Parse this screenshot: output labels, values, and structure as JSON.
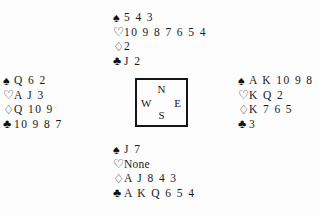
{
  "diagram": {
    "kind": "bridge-deal-diagram",
    "suit_symbols": {
      "spade": "♠",
      "heart": "♡",
      "diamond": "♢",
      "club": "♣"
    },
    "compass": {
      "north": "N",
      "west": "W",
      "east": "E",
      "south": "S"
    },
    "hands": {
      "north": {
        "spades": "5 4 3",
        "hearts": "10 9 8 7 6 5 4",
        "diamonds": "2",
        "clubs": "J 2"
      },
      "west": {
        "spades": "Q 6 2",
        "hearts": "A J 3",
        "diamonds": "Q 10 9",
        "clubs": "10 9 8 7"
      },
      "east": {
        "spades": "A K 10 9 8",
        "hearts": "K Q 2",
        "diamonds": "K 7 6 5",
        "clubs": "3"
      },
      "south": {
        "spades": "J 7",
        "hearts": "None",
        "diamonds": "A J 8 4 3",
        "clubs": "A K Q 6 5 4"
      }
    }
  }
}
